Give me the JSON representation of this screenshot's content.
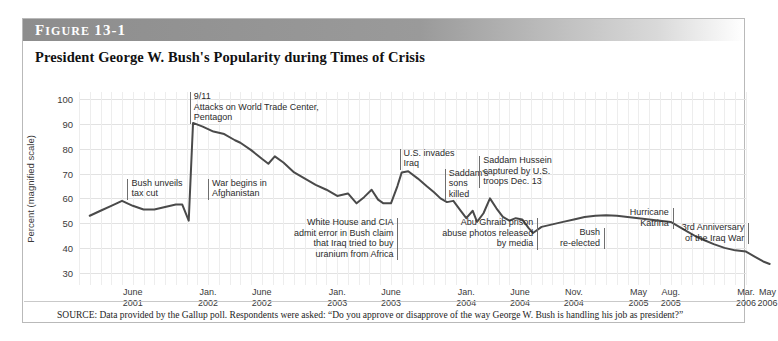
{
  "figure": {
    "label": "Figure 13-1",
    "title": "President George W. Bush's Popularity during Times of Crisis",
    "source_note": "SOURCE: Data provided by the Gallup poll. Respondents were asked: “Do you approve or disapprove of the way George W. Bush is handling his job as president?”"
  },
  "chart_data": {
    "type": "line",
    "title": "President George W. Bush's Popularity during Times of Crisis",
    "xlabel": "",
    "ylabel": "Percent (magnified scale)",
    "ylim": [
      25,
      103
    ],
    "yticks": [
      30,
      40,
      50,
      60,
      70,
      80,
      90,
      100
    ],
    "grid": true,
    "legend": "none",
    "xlim_months": [
      0,
      62
    ],
    "xtick_labels": [
      {
        "month_index": 5,
        "line1": "June",
        "line2": "2001"
      },
      {
        "month_index": 12,
        "line1": "Jan.",
        "line2": "2002"
      },
      {
        "month_index": 17,
        "line1": "June",
        "line2": "2002"
      },
      {
        "month_index": 24,
        "line1": "Jan.",
        "line2": "2003"
      },
      {
        "month_index": 29,
        "line1": "June",
        "line2": "2003"
      },
      {
        "month_index": 36,
        "line1": "Jan.",
        "line2": "2004"
      },
      {
        "month_index": 41,
        "line1": "June",
        "line2": "2004"
      },
      {
        "month_index": 46,
        "line1": "Nov.",
        "line2": "2004"
      },
      {
        "month_index": 52,
        "line1": "May",
        "line2": "2005"
      },
      {
        "month_index": 55,
        "line1": "Aug.",
        "line2": "2005"
      },
      {
        "month_index": 62,
        "line1": "Mar.",
        "line2": "2006"
      },
      {
        "month_index": 64,
        "line1": "May",
        "line2": "2006"
      }
    ],
    "series": [
      {
        "name": "Bush job approval",
        "color": "#4a4a4a",
        "points": [
          [
            1.0,
            53
          ],
          [
            2.0,
            55
          ],
          [
            3.0,
            57
          ],
          [
            4.0,
            59
          ],
          [
            5.0,
            57
          ],
          [
            6.0,
            55.5
          ],
          [
            7.0,
            55.5
          ],
          [
            8.0,
            56.5
          ],
          [
            9.0,
            57.5
          ],
          [
            9.6,
            57.5
          ],
          [
            10.2,
            51
          ],
          [
            10.6,
            90.5
          ],
          [
            11.5,
            89
          ],
          [
            12.5,
            87
          ],
          [
            13.5,
            86
          ],
          [
            14.5,
            83.5
          ],
          [
            15.0,
            82.5
          ],
          [
            16.0,
            79.5
          ],
          [
            17.0,
            76
          ],
          [
            17.6,
            74
          ],
          [
            18.2,
            77
          ],
          [
            19.0,
            74.5
          ],
          [
            20.0,
            70.5
          ],
          [
            21.0,
            68
          ],
          [
            22.0,
            65.5
          ],
          [
            23.0,
            63.5
          ],
          [
            24.0,
            61
          ],
          [
            25.0,
            62
          ],
          [
            25.8,
            58
          ],
          [
            26.5,
            60.5
          ],
          [
            27.2,
            63.5
          ],
          [
            27.8,
            59.5
          ],
          [
            28.3,
            58
          ],
          [
            29.0,
            58
          ],
          [
            29.6,
            65
          ],
          [
            30.0,
            70.5
          ],
          [
            30.6,
            71
          ],
          [
            31.5,
            68
          ],
          [
            32.3,
            65
          ],
          [
            33.0,
            62.5
          ],
          [
            33.6,
            60
          ],
          [
            34.2,
            58.5
          ],
          [
            34.8,
            59
          ],
          [
            35.4,
            55.5
          ],
          [
            36.0,
            52
          ],
          [
            36.6,
            55
          ],
          [
            37.0,
            50.5
          ],
          [
            37.6,
            54
          ],
          [
            38.2,
            60
          ],
          [
            38.8,
            56
          ],
          [
            39.4,
            52.5
          ],
          [
            40.0,
            51
          ],
          [
            40.6,
            52
          ],
          [
            41.2,
            51.5
          ],
          [
            41.8,
            48
          ],
          [
            42.2,
            46
          ],
          [
            43.0,
            48.5
          ],
          [
            44.0,
            49.5
          ],
          [
            45.0,
            50.5
          ],
          [
            46.0,
            51.5
          ],
          [
            47.0,
            52.5
          ],
          [
            48.0,
            53
          ],
          [
            49.0,
            53.2
          ],
          [
            50.0,
            53
          ],
          [
            51.0,
            52.5
          ],
          [
            52.0,
            52
          ],
          [
            53.0,
            51.5
          ],
          [
            54.0,
            51
          ],
          [
            55.0,
            50.5
          ],
          [
            55.8,
            48.5
          ],
          [
            56.6,
            46.5
          ],
          [
            57.4,
            44.5
          ],
          [
            58.2,
            43
          ],
          [
            59.0,
            41.5
          ],
          [
            60.0,
            40
          ],
          [
            61.0,
            39
          ],
          [
            62.0,
            38.5
          ],
          [
            62.8,
            36.5
          ],
          [
            63.6,
            34.5
          ],
          [
            64.2,
            33.5
          ]
        ]
      }
    ],
    "annotations": [
      {
        "id": "bush-unveils-tax-cut",
        "text_lines": [
          "Bush unveils",
          "tax cut"
        ],
        "align": "left",
        "month_index": 4.5,
        "value_top": 68
      },
      {
        "id": "nine-eleven",
        "text_lines": [
          "9/11",
          "Attacks on World Trade Center,",
          "Pentagon"
        ],
        "align": "left",
        "month_index": 10.3,
        "value_top": 103
      },
      {
        "id": "war-begins-afghanistan",
        "text_lines": [
          "War begins in",
          "Afghanistan"
        ],
        "align": "left",
        "month_index": 12.0,
        "value_top": 68
      },
      {
        "id": "white-house-cia-uranium",
        "text_lines": [
          "White House and CIA",
          "admit error in Bush claim",
          "that Iraq tried to buy",
          "uranium from Africa"
        ],
        "align": "right",
        "month_index": 29.6,
        "value_top": 52
      },
      {
        "id": "us-invades-iraq",
        "text_lines": [
          "U.S. invades",
          "Iraq"
        ],
        "align": "left",
        "month_index": 29.8,
        "value_top": 80
      },
      {
        "id": "saddams-sons-killed",
        "text_lines": [
          "Saddam's",
          "sons",
          "killed"
        ],
        "align": "left",
        "month_index": 34.0,
        "value_top": 72
      },
      {
        "id": "saddam-captured",
        "text_lines": [
          "Saddam Hussein",
          "captured by U.S.",
          "troops Dec. 13"
        ],
        "align": "left",
        "month_index": 37.2,
        "value_top": 77
      },
      {
        "id": "abu-ghraib",
        "text_lines": [
          "Abu Ghraib prison",
          "abuse photos released",
          "by media"
        ],
        "align": "right",
        "month_index": 42.6,
        "value_top": 52
      },
      {
        "id": "bush-re-elected",
        "text_lines": [
          "Bush",
          "re-elected"
        ],
        "align": "right",
        "month_index": 48.8,
        "value_top": 48
      },
      {
        "id": "hurricane-katrina",
        "text_lines": [
          "Hurricane",
          "Katrina"
        ],
        "align": "right",
        "month_index": 55.2,
        "value_top": 56
      },
      {
        "id": "third-anniversary-iraq",
        "text_lines": [
          "3rd Anniversary",
          "of the Iraq War"
        ],
        "align": "right",
        "month_index": 62.2,
        "value_top": 50
      }
    ]
  }
}
